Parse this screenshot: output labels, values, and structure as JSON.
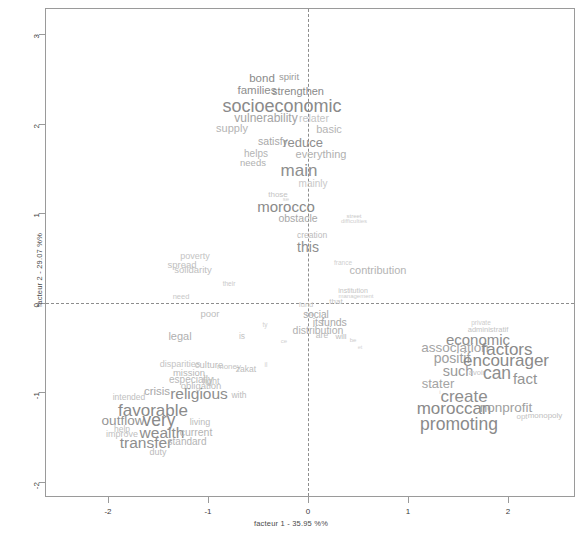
{
  "chart_data": {
    "type": "scatter",
    "title": "",
    "subtitle": "",
    "xlabel": "facteur 1 - 35.95 %%",
    "ylabel": "facteur 2 - 29.07 %%",
    "xlim": [
      -2.62,
      2.68
    ],
    "ylim": [
      -2.18,
      3.28
    ],
    "xticks": [
      -2,
      -1,
      0,
      1,
      2
    ],
    "xticklabels": [
      "-2",
      "-1",
      "0",
      "1",
      "2"
    ],
    "yticks": [
      3,
      2,
      1,
      0,
      -1,
      -2
    ],
    "yticklabels": [
      "3",
      "2",
      "1",
      "0",
      "-1",
      "-2"
    ],
    "grid": false,
    "legend": null,
    "reference_lines": {
      "x": 0,
      "y": 0,
      "style": "dashed",
      "color": "#8d8d8d"
    },
    "point_style": "word-labels",
    "note": "Correspondence analysis word plot: each data point is rendered as its word label; label font size scales with the word's weight/contribution.",
    "words": [
      {
        "text": "bond",
        "x": -0.46,
        "y": 2.5,
        "size": 11.5,
        "color": "#8a8a8a"
      },
      {
        "text": "spirit",
        "x": -0.19,
        "y": 2.52,
        "size": 9.5,
        "color": "#9a9a9a"
      },
      {
        "text": "families",
        "x": -0.51,
        "y": 2.37,
        "size": 11.5,
        "color": "#8e8e8e"
      },
      {
        "text": "strengthen",
        "x": -0.1,
        "y": 2.37,
        "size": 11.0,
        "color": "#8a8a8a"
      },
      {
        "text": "socioeconomic",
        "x": -0.26,
        "y": 2.2,
        "size": 18.0,
        "color": "#8a8a8a"
      },
      {
        "text": "vulnerability",
        "x": -0.42,
        "y": 2.06,
        "size": 12.0,
        "color": "#a4a4a4"
      },
      {
        "text": "relater",
        "x": 0.06,
        "y": 2.06,
        "size": 10.5,
        "color": "#c4c4c4"
      },
      {
        "text": "supply",
        "x": -0.76,
        "y": 1.95,
        "size": 11.0,
        "color": "#b4b4b4"
      },
      {
        "text": "basic",
        "x": 0.21,
        "y": 1.94,
        "size": 11.0,
        "color": "#b4b4b4"
      },
      {
        "text": "satisfy",
        "x": -0.35,
        "y": 1.81,
        "size": 10.5,
        "color": "#a8a8a8"
      },
      {
        "text": "reduce",
        "x": -0.05,
        "y": 1.8,
        "size": 13.0,
        "color": "#8e8e8e"
      },
      {
        "text": "everything",
        "x": 0.13,
        "y": 1.66,
        "size": 11.0,
        "color": "#b0b0b0"
      },
      {
        "text": "helps",
        "x": -0.52,
        "y": 1.66,
        "size": 10.0,
        "color": "#b4b4b4"
      },
      {
        "text": "needs",
        "x": -0.55,
        "y": 1.56,
        "size": 9.5,
        "color": "#b0b0b0"
      },
      {
        "text": "main",
        "x": -0.09,
        "y": 1.48,
        "size": 17.0,
        "color": "#8e8e8e"
      },
      {
        "text": "mainly",
        "x": 0.05,
        "y": 1.33,
        "size": 10.0,
        "color": "#c8c8c8"
      },
      {
        "text": "those",
        "x": -0.3,
        "y": 1.2,
        "size": 8.0,
        "color": "#c4c4c4"
      },
      {
        "text": "se",
        "x": -0.22,
        "y": 1.16,
        "size": 6.0,
        "color": "#d0d0d0"
      },
      {
        "text": "morocco",
        "x": -0.22,
        "y": 1.08,
        "size": 15.0,
        "color": "#8a8a8a"
      },
      {
        "text": "obstacle",
        "x": -0.1,
        "y": 0.95,
        "size": 10.5,
        "color": "#a8a8a8"
      },
      {
        "text": "street",
        "x": 0.46,
        "y": 0.97,
        "size": 6.0,
        "color": "#c8c8c8"
      },
      {
        "text": "difficulties",
        "x": 0.46,
        "y": 0.91,
        "size": 6.0,
        "color": "#cfcfcf"
      },
      {
        "text": "creation",
        "x": 0.04,
        "y": 0.76,
        "size": 8.5,
        "color": "#bcbcbc"
      },
      {
        "text": "this",
        "x": 0.0,
        "y": 0.62,
        "size": 14.0,
        "color": "#8e8e8e"
      },
      {
        "text": "poverty",
        "x": -1.13,
        "y": 0.52,
        "size": 9.0,
        "color": "#c4c4c4"
      },
      {
        "text": "france",
        "x": 0.35,
        "y": 0.44,
        "size": 6.5,
        "color": "#cfcfcf"
      },
      {
        "text": "spread",
        "x": -1.26,
        "y": 0.42,
        "size": 9.5,
        "color": "#c0c0c0"
      },
      {
        "text": "solidarity",
        "x": -1.15,
        "y": 0.37,
        "size": 9.5,
        "color": "#c0c0c0"
      },
      {
        "text": "contribution",
        "x": 0.7,
        "y": 0.37,
        "size": 11.0,
        "color": "#b4b4b4"
      },
      {
        "text": "their",
        "x": -0.79,
        "y": 0.21,
        "size": 6.5,
        "color": "#c8c8c8"
      },
      {
        "text": "institution",
        "x": 0.45,
        "y": 0.14,
        "size": 7.0,
        "color": "#c4c4c4"
      },
      {
        "text": "management",
        "x": 0.48,
        "y": 0.08,
        "size": 6.0,
        "color": "#cccccc"
      },
      {
        "text": "need",
        "x": -1.27,
        "y": 0.06,
        "size": 7.5,
        "color": "#c8c8c8"
      },
      {
        "text": "fund",
        "x": -0.02,
        "y": -0.02,
        "size": 7.5,
        "color": "#c8c8c8"
      },
      {
        "text": "that",
        "x": 0.28,
        "y": 0.01,
        "size": 8.0,
        "color": "#c4c4c4"
      },
      {
        "text": "poor",
        "x": -0.98,
        "y": -0.12,
        "size": 9.5,
        "color": "#bdbdbd"
      },
      {
        "text": "ma",
        "x": 0.02,
        "y": -0.13,
        "size": 6.0,
        "color": "#cccccc"
      },
      {
        "text": "social",
        "x": 0.08,
        "y": -0.14,
        "size": 10.0,
        "color": "#a8a8a8"
      },
      {
        "text": "its",
        "x": 0.1,
        "y": -0.22,
        "size": 10.5,
        "color": "#aeaeae"
      },
      {
        "text": "funds",
        "x": 0.26,
        "y": -0.22,
        "size": 10.5,
        "color": "#a8a8a8"
      },
      {
        "text": "distribution",
        "x": 0.1,
        "y": -0.3,
        "size": 10.5,
        "color": "#b0b0b0"
      },
      {
        "text": "private",
        "x": 1.73,
        "y": -0.23,
        "size": 6.5,
        "color": "#cccccc"
      },
      {
        "text": "ty",
        "x": -0.43,
        "y": -0.25,
        "size": 6.5,
        "color": "#d0d0d0"
      },
      {
        "text": "administratif",
        "x": 1.8,
        "y": -0.3,
        "size": 7.5,
        "color": "#c4c4c4"
      },
      {
        "text": "are",
        "x": 0.14,
        "y": -0.36,
        "size": 8.5,
        "color": "#bcbcbc"
      },
      {
        "text": "will",
        "x": 0.33,
        "y": -0.38,
        "size": 8.0,
        "color": "#bcbcbc"
      },
      {
        "text": "legal",
        "x": -1.28,
        "y": -0.37,
        "size": 11.0,
        "color": "#b0b0b0"
      },
      {
        "text": "is",
        "x": -0.66,
        "y": -0.37,
        "size": 8.5,
        "color": "#c4c4c4"
      },
      {
        "text": "economic",
        "x": 1.7,
        "y": -0.4,
        "size": 15.0,
        "color": "#8e8e8e"
      },
      {
        "text": "be",
        "x": 0.45,
        "y": -0.42,
        "size": 6.0,
        "color": "#cccccc"
      },
      {
        "text": "ce",
        "x": -0.24,
        "y": -0.43,
        "size": 6.0,
        "color": "#d0d0d0"
      },
      {
        "text": "association",
        "x": 1.47,
        "y": -0.51,
        "size": 13.5,
        "color": "#a4a4a4"
      },
      {
        "text": "factors",
        "x": 1.99,
        "y": -0.52,
        "size": 17.0,
        "color": "#8a8a8a"
      },
      {
        "text": "et",
        "x": 0.52,
        "y": -0.5,
        "size": 5.5,
        "color": "#d4d4d4"
      },
      {
        "text": "positif",
        "x": 1.44,
        "y": -0.62,
        "size": 14.0,
        "color": "#a0a0a0"
      },
      {
        "text": "encourager",
        "x": 1.98,
        "y": -0.64,
        "size": 17.0,
        "color": "#8a8a8a"
      },
      {
        "text": "such",
        "x": 1.5,
        "y": -0.76,
        "size": 14.5,
        "color": "#9a9a9a"
      },
      {
        "text": "avoir",
        "x": 1.69,
        "y": -0.78,
        "size": 7.5,
        "color": "#c4c4c4"
      },
      {
        "text": "can",
        "x": 1.89,
        "y": -0.8,
        "size": 17.5,
        "color": "#8e8e8e"
      },
      {
        "text": "fact",
        "x": 2.17,
        "y": -0.84,
        "size": 15.0,
        "color": "#949494"
      },
      {
        "text": "disparities",
        "x": -1.28,
        "y": -0.68,
        "size": 9.0,
        "color": "#c4c4c4"
      },
      {
        "text": "culture",
        "x": -0.99,
        "y": -0.7,
        "size": 9.5,
        "color": "#bcbcbc"
      },
      {
        "text": "money",
        "x": -0.79,
        "y": -0.72,
        "size": 8.0,
        "color": "#c4c4c4"
      },
      {
        "text": "zakat",
        "x": -0.62,
        "y": -0.74,
        "size": 8.5,
        "color": "#bcbcbc"
      },
      {
        "text": "il",
        "x": -0.42,
        "y": -0.7,
        "size": 6.5,
        "color": "#d0d0d0"
      },
      {
        "text": "mission",
        "x": -1.19,
        "y": -0.78,
        "size": 9.5,
        "color": "#b8b8b8"
      },
      {
        "text": "especially",
        "x": -1.17,
        "y": -0.86,
        "size": 10.0,
        "color": "#b8b8b8"
      },
      {
        "text": "fight",
        "x": -0.97,
        "y": -0.87,
        "size": 9.0,
        "color": "#bcbcbc"
      },
      {
        "text": "obligation",
        "x": -1.07,
        "y": -0.93,
        "size": 9.5,
        "color": "#bcbcbc"
      },
      {
        "text": "stater",
        "x": 1.3,
        "y": -0.9,
        "size": 13.0,
        "color": "#a4a4a4"
      },
      {
        "text": "crisis",
        "x": -1.51,
        "y": -1.0,
        "size": 11.5,
        "color": "#a8a8a8"
      },
      {
        "text": "religious",
        "x": -1.09,
        "y": -1.02,
        "size": 15.5,
        "color": "#8e8e8e"
      },
      {
        "text": "with",
        "x": -0.69,
        "y": -1.03,
        "size": 8.5,
        "color": "#bcbcbc"
      },
      {
        "text": "intended",
        "x": -1.79,
        "y": -1.05,
        "size": 8.5,
        "color": "#c0c0c0"
      },
      {
        "text": "create",
        "x": 1.56,
        "y": -1.04,
        "size": 17.0,
        "color": "#8e8e8e"
      },
      {
        "text": "i",
        "x": 1.32,
        "y": -1.0,
        "size": 6.0,
        "color": "#d0d0d0"
      },
      {
        "text": "moroccan",
        "x": 1.46,
        "y": -1.18,
        "size": 17.0,
        "color": "#8a8a8a"
      },
      {
        "text": "nonprofit",
        "x": 1.98,
        "y": -1.18,
        "size": 13.5,
        "color": "#a0a0a0"
      },
      {
        "text": "favorable",
        "x": -1.55,
        "y": -1.2,
        "size": 17.0,
        "color": "#8a8a8a"
      },
      {
        "text": "opt",
        "x": 2.14,
        "y": -1.27,
        "size": 8.0,
        "color": "#c4c4c4"
      },
      {
        "text": "monopoly",
        "x": 2.37,
        "y": -1.26,
        "size": 8.0,
        "color": "#c0c0c0"
      },
      {
        "text": "outflow",
        "x": -1.85,
        "y": -1.32,
        "size": 13.5,
        "color": "#949494"
      },
      {
        "text": "very",
        "x": -1.49,
        "y": -1.32,
        "size": 17.5,
        "color": "#8a8a8a"
      },
      {
        "text": "living",
        "x": -1.08,
        "y": -1.33,
        "size": 9.0,
        "color": "#bcbcbc"
      },
      {
        "text": "promoting",
        "x": 1.51,
        "y": -1.37,
        "size": 17.5,
        "color": "#8a8a8a"
      },
      {
        "text": "help",
        "x": -1.86,
        "y": -1.41,
        "size": 8.5,
        "color": "#c0c0c0"
      },
      {
        "text": "wealth",
        "x": -1.46,
        "y": -1.45,
        "size": 15.5,
        "color": "#8e8e8e"
      },
      {
        "text": "current",
        "x": -1.12,
        "y": -1.44,
        "size": 10.5,
        "color": "#b4b4b4"
      },
      {
        "text": "improve",
        "x": -1.86,
        "y": -1.47,
        "size": 9.0,
        "color": "#c0c0c0"
      },
      {
        "text": "transfer",
        "x": -1.62,
        "y": -1.57,
        "size": 15.5,
        "color": "#8e8e8e"
      },
      {
        "text": "standard",
        "x": -1.21,
        "y": -1.56,
        "size": 10.0,
        "color": "#b4b4b4"
      },
      {
        "text": "duty",
        "x": -1.5,
        "y": -1.67,
        "size": 9.0,
        "color": "#bcbcbc"
      }
    ]
  }
}
